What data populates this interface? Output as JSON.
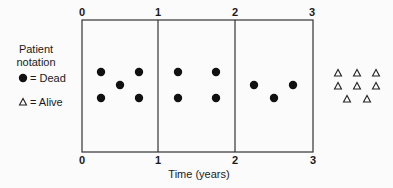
{
  "legend": {
    "title_line1": "Patient",
    "title_line2": "notation",
    "dead_label": "= Dead",
    "alive_label": "= Alive",
    "dead_symbol": "filled-circle",
    "alive_symbol": "open-triangle"
  },
  "axis": {
    "xlabel": "Time (years)",
    "ticks_top": [
      "0",
      "1",
      "2",
      "3"
    ],
    "ticks_bottom": [
      "0",
      "1",
      "2",
      "3"
    ]
  },
  "intervals": [
    {
      "range": "0-1",
      "deaths": 5
    },
    {
      "range": "1-2",
      "deaths": 4
    },
    {
      "range": "2-3",
      "deaths": 3
    }
  ],
  "alive_after_3_years": 8,
  "colors": {
    "ink": "#1a1a1a",
    "background": "#fbfbfb"
  }
}
